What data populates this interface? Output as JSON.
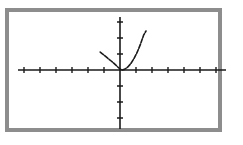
{
  "screen": {
    "width": 243,
    "height": 145,
    "page_background": "#ffffff",
    "frame_color": "#8d8d8d",
    "frame_border_width": 4,
    "frame_rect": {
      "x": 5,
      "y": 8,
      "width": 217,
      "height": 124
    },
    "plot_background": "#ffffff",
    "ink_color": "#1a1a1a"
  },
  "chart_data": {
    "type": "line",
    "title": "",
    "subtitle": "",
    "xlabel": "",
    "ylabel": "",
    "legend": [],
    "legend_position": "none",
    "grid": false,
    "axis_style": "graphing-calculator",
    "tick_labels_visible": false,
    "xlim": [
      -6.4,
      6.5
    ],
    "ylim": [
      -3.5,
      3.4
    ],
    "xticks": [
      -6,
      -5,
      -4,
      -3,
      -2,
      -1,
      1,
      2,
      3,
      4,
      5,
      6
    ],
    "yticks": [
      -3,
      -2,
      -1,
      1,
      2,
      3
    ],
    "tick_spacing_px": 16,
    "origin_px": {
      "x": 120,
      "y": 70
    },
    "x_axis_px": {
      "x1": 18,
      "x2": 226,
      "y": 70
    },
    "y_axis_px": {
      "x": 120,
      "y1": 17,
      "y2": 129
    },
    "tick_half_length_px": 3,
    "series": [
      {
        "name": "curve",
        "description": "upward-opening parabola, vertex on the x-axis just right of the origin",
        "stroke": "#1a1a1a",
        "stroke_width": 1.6,
        "dashed": true,
        "vertex": [
          0.2,
          0.0
        ],
        "x": [
          -1.3,
          -1.1,
          -0.9,
          -0.7,
          -0.5,
          -0.3,
          -0.1,
          0.1,
          0.2,
          0.35,
          0.55,
          0.75,
          0.95,
          1.15,
          1.35,
          1.55,
          1.75
        ],
        "y": [
          2.25,
          1.69,
          1.21,
          0.81,
          0.49,
          0.25,
          0.09,
          0.01,
          0.0,
          0.0225,
          0.1225,
          0.3025,
          0.5625,
          0.9025,
          1.3225,
          1.8225,
          2.4025
        ],
        "path_px": [
          [
            100.2,
            52.1
          ],
          [
            102.4,
            53.9
          ],
          [
            104.6,
            55.6
          ],
          [
            106.8,
            57.4
          ],
          [
            109.0,
            59.2
          ],
          [
            111.2,
            61.0
          ],
          [
            113.4,
            62.9
          ],
          [
            115.6,
            64.9
          ],
          [
            117.8,
            67.0
          ],
          [
            120.0,
            69.0
          ],
          [
            122.0,
            70.0
          ],
          [
            124.4,
            69.4
          ],
          [
            127.6,
            67.2
          ],
          [
            130.8,
            63.6
          ],
          [
            134.0,
            58.6
          ],
          [
            137.2,
            52.2
          ],
          [
            140.4,
            44.4
          ],
          [
            143.6,
            35.2
          ],
          [
            146.0,
            31.0
          ]
        ]
      }
    ]
  }
}
